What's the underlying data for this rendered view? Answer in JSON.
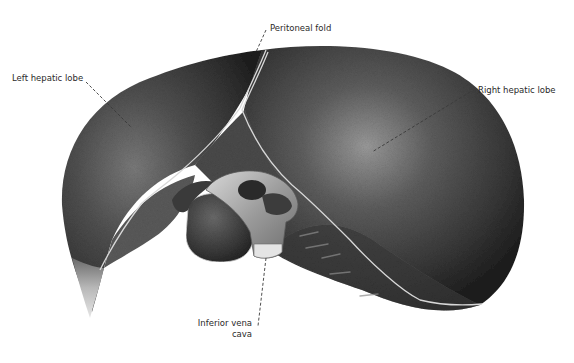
{
  "figure": {
    "colors": {
      "background": "#ffffff",
      "organ_dark": "#2b2b2b",
      "organ_mid": "#4a4a4a",
      "organ_highlight": "#8a8a8a",
      "fold_line": "#d8d8d8",
      "vessel_light": "#bdbdbd",
      "label_text": "#2a2a2a",
      "leader_line": "#3a3a3a"
    }
  },
  "labels": {
    "left_lobe": "Left hepatic lobe",
    "peritoneal_fold": "Peritoneal fold",
    "right_lobe": "Right hepatic lobe",
    "ivc_line1": "Inferior vena",
    "ivc_line2": "cava"
  }
}
